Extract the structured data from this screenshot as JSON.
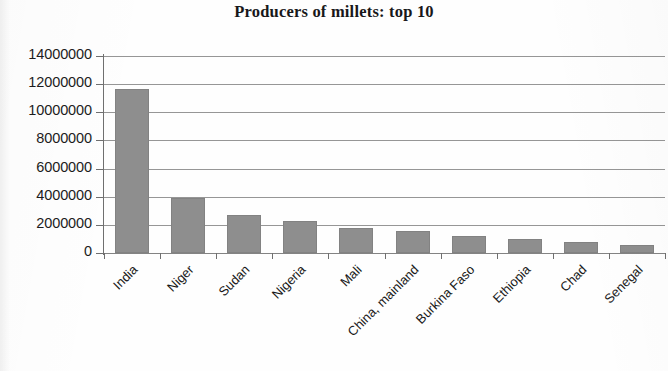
{
  "chart_data": {
    "type": "bar",
    "title": "Producers of millets: top 10",
    "xlabel": "",
    "ylabel": "",
    "ylim": [
      0,
      14000000
    ],
    "ytick_step": 2000000,
    "grid": "horizontal",
    "legend": "none",
    "bar_color": "#8e8e8e",
    "categories": [
      "India",
      "Niger",
      "Sudan",
      "Nigeria",
      "Mali",
      "China, mainland",
      "Burkina Faso",
      "Ethiopia",
      "Chad",
      "Senegal"
    ],
    "values": [
      11650000,
      3900000,
      2700000,
      2300000,
      1800000,
      1600000,
      1200000,
      1000000,
      800000,
      550000
    ],
    "ytick_labels": [
      "14000000",
      "12000000",
      "10000000",
      "8000000",
      "6000000",
      "4000000",
      "2000000",
      "0"
    ],
    "ytick_values": [
      14000000,
      12000000,
      10000000,
      8000000,
      6000000,
      4000000,
      2000000,
      0
    ]
  }
}
